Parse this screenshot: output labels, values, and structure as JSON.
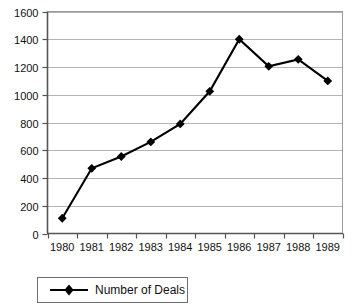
{
  "chart_data": {
    "type": "line",
    "title": "",
    "subtitle": "",
    "xlabel": "",
    "ylabel": "",
    "categories": [
      "1980",
      "1981",
      "1982",
      "1983",
      "1984",
      "1985",
      "1986",
      "1987",
      "1988",
      "1989"
    ],
    "series": [
      {
        "name": "Number of Deals",
        "values": [
          110,
          470,
          555,
          660,
          790,
          1025,
          1400,
          1205,
          1255,
          1100
        ],
        "color": "#000000",
        "marker": "diamond"
      }
    ],
    "ylim": [
      0,
      1600
    ],
    "yticks": [
      0,
      200,
      400,
      600,
      800,
      1000,
      1200,
      1400,
      1600
    ],
    "ytick_labels": [
      "0",
      "200",
      "400",
      "600",
      "800",
      "1000",
      "1200",
      "1400",
      "1600"
    ],
    "xtick_labels": [
      "1980",
      "1981",
      "1982",
      "1983",
      "1984",
      "1985",
      "1986",
      "1987",
      "1988",
      "1989"
    ],
    "grid": "horizontal",
    "grid_color": "#b4b4b4",
    "axis_color": "#555555",
    "plot_background": "#ffffff",
    "legend": {
      "position": "bottom-left",
      "border_color": "#6e6e6e",
      "entries": [
        {
          "label": "Number of Deals",
          "color": "#000000",
          "marker": "diamond"
        }
      ]
    },
    "annotations": []
  }
}
